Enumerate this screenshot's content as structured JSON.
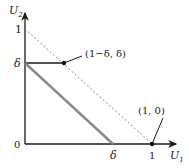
{
  "diagram": {
    "axes": {
      "x_label": "U",
      "x_sub": "1",
      "y_label": "U",
      "y_sub": "2",
      "origin_label": "0"
    },
    "ticks": {
      "y_one": "1",
      "y_delta": "δ",
      "x_delta": "δ",
      "x_one": "1"
    },
    "points": {
      "corner": "(1−δ, δ)",
      "x_intercept": "(1, 0)"
    },
    "colors": {
      "axis": "#1a1a1a",
      "dashed": "#888888",
      "thick_gray": "#8a8a8a",
      "text": "#222222"
    }
  }
}
